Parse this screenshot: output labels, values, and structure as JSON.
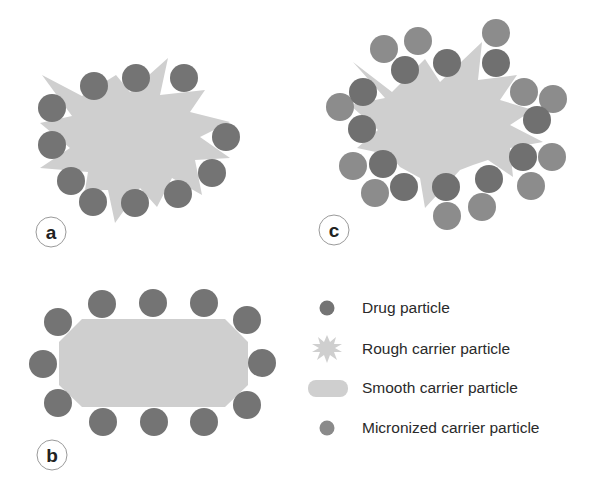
{
  "colors": {
    "background": "#ffffff",
    "drug_particle": "#747474",
    "micronized_particle": "#8c8c8c",
    "carrier": "#cfcfcf",
    "label_ring": "#9a9a9a",
    "text": "#2a2a2a"
  },
  "panels": [
    {
      "id": "a",
      "label": "a",
      "description": "Rough carrier particle with drug particles adhered to surface"
    },
    {
      "id": "b",
      "label": "b",
      "description": "Smooth carrier particle with drug particles adhered to surface"
    },
    {
      "id": "c",
      "label": "c",
      "description": "Rough carrier particle with drug particles and micronized carrier particles"
    }
  ],
  "legend": [
    {
      "icon": "drug-particle-icon",
      "label": "Drug particle"
    },
    {
      "icon": "rough-carrier-icon",
      "label": "Rough carrier particle"
    },
    {
      "icon": "smooth-carrier-icon",
      "label": "Smooth carrier particle"
    },
    {
      "icon": "micronized-carrier-icon",
      "label": "Micronized carrier particle"
    }
  ]
}
